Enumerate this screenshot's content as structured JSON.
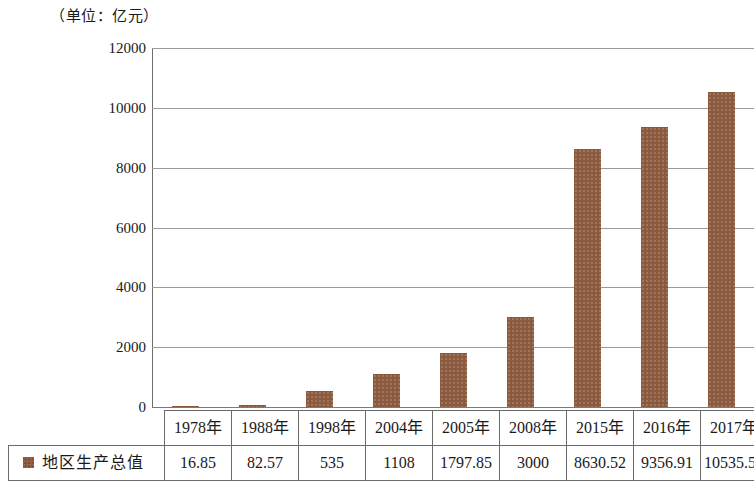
{
  "caption": "（单位：亿元）",
  "chart_data": {
    "type": "bar",
    "title": "",
    "subtitle": "",
    "xlabel": "",
    "ylabel": "",
    "unit_note": "（单位：亿元）",
    "categories": [
      "1978年",
      "1988年",
      "1998年",
      "2004年",
      "2005年",
      "2008年",
      "2015年",
      "2016年",
      "2017年"
    ],
    "series": [
      {
        "name": "地区生产总值",
        "color": "#8c5a3e",
        "values": [
          16.85,
          82.57,
          535,
          1108,
          1797.85,
          3000,
          8630.52,
          9356.91,
          10535.51
        ]
      }
    ],
    "ylim": [
      0,
      12000
    ],
    "yticks": [
      0,
      2000,
      4000,
      6000,
      8000,
      10000,
      12000
    ],
    "ytick_labels": [
      "0",
      "2000",
      "4000",
      "6000",
      "8000",
      "10000",
      "12000"
    ],
    "grid": true,
    "legend_position": "table-row",
    "value_labels": [
      "16.85",
      "82.57",
      "535",
      "1108",
      "1797.85",
      "3000",
      "8630.52",
      "9356.91",
      "10535.51"
    ]
  },
  "table": {
    "legend_label": "地区生产总值",
    "years": [
      "1978年",
      "1988年",
      "1998年",
      "2004年",
      "2005年",
      "2008年",
      "2015年",
      "2016年",
      "2017年"
    ],
    "values": [
      "16.85",
      "82.57",
      "535",
      "1108",
      "1797.85",
      "3000",
      "8630.52",
      "9356.91",
      "10535.51"
    ]
  },
  "colors": {
    "bar": "#8c5a3e",
    "gridline": "#9a9a9a",
    "axis": "#6e6e6e",
    "table_border": "#6b6b6b",
    "background": "#ffffff",
    "text": "#1a1a1a"
  }
}
